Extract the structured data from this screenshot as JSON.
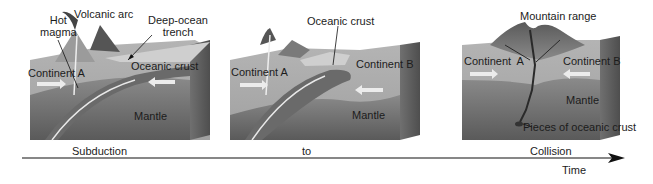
{
  "panels": [
    {
      "name": "subduction",
      "labels": {
        "hot_magma_1": "Hot",
        "hot_magma_2": "magma",
        "volcanic_arc": "Volcanic arc",
        "trench_1": "Deep-ocean",
        "trench_2": "trench",
        "oceanic_crust": "Oceanic crust",
        "continent_a": "Continent A",
        "mantle": "Mantle"
      }
    },
    {
      "name": "transition",
      "labels": {
        "oceanic_crust": "Oceanic crust",
        "continent_a": "Continent A",
        "continent_b": "Continent B",
        "mantle": "Mantle"
      }
    },
    {
      "name": "collision",
      "labels": {
        "mountain_range": "Mountain range",
        "continent_a": "Continent  A",
        "continent_b": "Continent B",
        "mantle": "Mantle",
        "oceanic_pieces": "Pieces of oceanic crust"
      }
    }
  ],
  "timeline": {
    "start": "Subduction",
    "middle": "to",
    "end": "Collision",
    "axis_label": "Time"
  }
}
